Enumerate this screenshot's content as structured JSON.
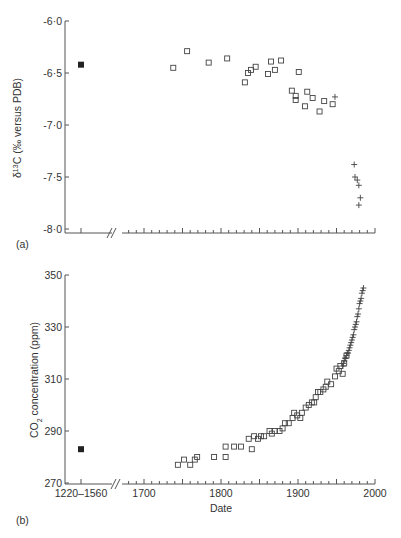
{
  "figure": {
    "panel_a_label": "(a)",
    "panel_b_label": "(b)"
  },
  "chart_data": [
    {
      "type": "scatter",
      "panel": "(a)",
      "title": "",
      "xlabel": "",
      "ylabel": "δ13C (‰ versus PDB)",
      "ylabel_parts": {
        "delta": "δ",
        "sup": "13",
        "rest": "C (‰ versus PDB)"
      },
      "ylim": [
        -8.0,
        -6.0
      ],
      "yticks": [
        "-6·0",
        "-6·5",
        "-7·0",
        "-7·5",
        "-8·0"
      ],
      "ytick_values": [
        -6.0,
        -6.5,
        -7.0,
        -7.5,
        -8.0
      ],
      "xlim": [
        1640,
        2000
      ],
      "x_axis_break": true,
      "grid": false,
      "series": [
        {
          "name": "1220–1560 (filled)",
          "marker": "filled-square",
          "points": [
            {
              "x": "1220–1560",
              "y": -6.42
            }
          ]
        },
        {
          "name": "Tree-ring / ice samples",
          "marker": "open-square",
          "points": [
            {
              "x": 1738,
              "y": -6.45
            },
            {
              "x": 1756,
              "y": -6.29
            },
            {
              "x": 1784,
              "y": -6.4
            },
            {
              "x": 1808,
              "y": -6.36
            },
            {
              "x": 1831,
              "y": -6.59
            },
            {
              "x": 1835,
              "y": -6.5
            },
            {
              "x": 1839,
              "y": -6.47
            },
            {
              "x": 1845,
              "y": -6.44
            },
            {
              "x": 1861,
              "y": -6.51
            },
            {
              "x": 1865,
              "y": -6.39
            },
            {
              "x": 1870,
              "y": -6.47
            },
            {
              "x": 1878,
              "y": -6.38
            },
            {
              "x": 1892,
              "y": -6.67
            },
            {
              "x": 1897,
              "y": -6.72
            },
            {
              "x": 1901,
              "y": -6.49
            },
            {
              "x": 1897,
              "y": -6.76
            },
            {
              "x": 1909,
              "y": -6.82
            },
            {
              "x": 1912,
              "y": -6.68
            },
            {
              "x": 1919,
              "y": -6.74
            },
            {
              "x": 1928,
              "y": -6.87
            },
            {
              "x": 1934,
              "y": -6.77
            },
            {
              "x": 1945,
              "y": -6.8
            }
          ]
        },
        {
          "name": "Atmospheric measurements",
          "marker": "plus",
          "points": [
            {
              "x": 1948,
              "y": -6.73
            },
            {
              "x": 1973,
              "y": -7.38
            },
            {
              "x": 1974,
              "y": -7.5
            },
            {
              "x": 1977,
              "y": -7.53
            },
            {
              "x": 1979,
              "y": -7.58
            },
            {
              "x": 1981,
              "y": -7.7
            },
            {
              "x": 1979,
              "y": -7.77
            }
          ]
        }
      ]
    },
    {
      "type": "scatter",
      "panel": "(b)",
      "title": "",
      "xlabel": "Date",
      "ylabel": "CO2 concentration (ppm)",
      "ylabel_parts": {
        "pre": "CO",
        "sub": "2",
        "rest": " concentration (ppm)"
      },
      "ylim": [
        270,
        350
      ],
      "yticks": [
        "350",
        "330",
        "310",
        "290",
        "270"
      ],
      "ytick_values": [
        350,
        330,
        310,
        290,
        270
      ],
      "xticks": [
        "1220–1560",
        "1700",
        "1800",
        "1900",
        "2000"
      ],
      "xlim": [
        1640,
        2000
      ],
      "x_axis_break": true,
      "grid": false,
      "series": [
        {
          "name": "1220–1560 (filled)",
          "marker": "filled-square",
          "points": [
            {
              "x": "1220–1560",
              "y": 283
            }
          ]
        },
        {
          "name": "Ice-core samples",
          "marker": "open-square",
          "points": [
            {
              "x": 1744,
              "y": 277
            },
            {
              "x": 1752,
              "y": 279
            },
            {
              "x": 1760,
              "y": 277
            },
            {
              "x": 1766,
              "y": 279
            },
            {
              "x": 1769,
              "y": 280
            },
            {
              "x": 1791,
              "y": 280
            },
            {
              "x": 1806,
              "y": 280
            },
            {
              "x": 1806,
              "y": 284
            },
            {
              "x": 1817,
              "y": 284
            },
            {
              "x": 1826,
              "y": 284
            },
            {
              "x": 1836,
              "y": 287
            },
            {
              "x": 1840,
              "y": 283
            },
            {
              "x": 1843,
              "y": 288
            },
            {
              "x": 1848,
              "y": 287
            },
            {
              "x": 1852,
              "y": 288
            },
            {
              "x": 1856,
              "y": 288
            },
            {
              "x": 1863,
              "y": 290
            },
            {
              "x": 1866,
              "y": 289
            },
            {
              "x": 1870,
              "y": 290
            },
            {
              "x": 1876,
              "y": 290
            },
            {
              "x": 1880,
              "y": 291
            },
            {
              "x": 1883,
              "y": 293
            },
            {
              "x": 1888,
              "y": 293
            },
            {
              "x": 1893,
              "y": 295
            },
            {
              "x": 1895,
              "y": 297
            },
            {
              "x": 1899,
              "y": 296
            },
            {
              "x": 1903,
              "y": 295
            },
            {
              "x": 1905,
              "y": 297
            },
            {
              "x": 1910,
              "y": 299
            },
            {
              "x": 1914,
              "y": 300
            },
            {
              "x": 1918,
              "y": 301
            },
            {
              "x": 1921,
              "y": 301
            },
            {
              "x": 1923,
              "y": 303
            },
            {
              "x": 1926,
              "y": 305
            },
            {
              "x": 1929,
              "y": 305
            },
            {
              "x": 1933,
              "y": 306
            },
            {
              "x": 1936,
              "y": 307
            },
            {
              "x": 1938,
              "y": 309
            },
            {
              "x": 1943,
              "y": 308
            },
            {
              "x": 1948,
              "y": 311
            },
            {
              "x": 1950,
              "y": 314
            },
            {
              "x": 1953,
              "y": 313
            },
            {
              "x": 1955,
              "y": 315
            },
            {
              "x": 1958,
              "y": 312
            },
            {
              "x": 1960,
              "y": 316
            },
            {
              "x": 1963,
              "y": 319
            }
          ]
        },
        {
          "name": "Mauna Loa atmospheric",
          "marker": "plus",
          "points": [
            {
              "x": 1958,
              "y": 315
            },
            {
              "x": 1959,
              "y": 316
            },
            {
              "x": 1960,
              "y": 317
            },
            {
              "x": 1961,
              "y": 318
            },
            {
              "x": 1962,
              "y": 318
            },
            {
              "x": 1963,
              "y": 319
            },
            {
              "x": 1964,
              "y": 320
            },
            {
              "x": 1965,
              "y": 320
            },
            {
              "x": 1966,
              "y": 321
            },
            {
              "x": 1967,
              "y": 322
            },
            {
              "x": 1968,
              "y": 323
            },
            {
              "x": 1969,
              "y": 324
            },
            {
              "x": 1970,
              "y": 325
            },
            {
              "x": 1971,
              "y": 326
            },
            {
              "x": 1972,
              "y": 327
            },
            {
              "x": 1973,
              "y": 329
            },
            {
              "x": 1974,
              "y": 330
            },
            {
              "x": 1975,
              "y": 331
            },
            {
              "x": 1976,
              "y": 332
            },
            {
              "x": 1977,
              "y": 334
            },
            {
              "x": 1978,
              "y": 335
            },
            {
              "x": 1979,
              "y": 337
            },
            {
              "x": 1980,
              "y": 339
            },
            {
              "x": 1981,
              "y": 340
            },
            {
              "x": 1982,
              "y": 341
            },
            {
              "x": 1983,
              "y": 343
            },
            {
              "x": 1984,
              "y": 344
            },
            {
              "x": 1985,
              "y": 345
            }
          ]
        }
      ]
    }
  ]
}
